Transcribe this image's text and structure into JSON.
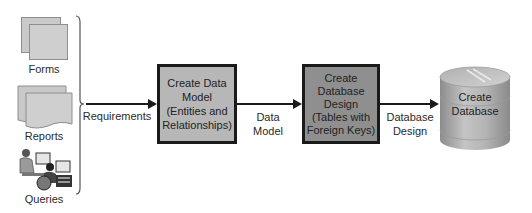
{
  "inputs": {
    "forms_label": "Forms",
    "reports_label": "Reports",
    "queries_label": "Queries"
  },
  "flow": {
    "arrow1_label": "Requirements",
    "step1": {
      "line1": "Create Data",
      "line2": "Model",
      "line3": "(Entities and",
      "line4": "Relationships)"
    },
    "arrow2_label_line1": "Data",
    "arrow2_label_line2": "Model",
    "step2": {
      "line1": "Create",
      "line2": "Database",
      "line3": "Design",
      "line4": "(Tables with",
      "line5": "Foreign Keys)"
    },
    "arrow3_label_line1": "Database",
    "arrow3_label_line2": "Design",
    "step3": {
      "line1": "Create",
      "line2": "Database"
    }
  },
  "colors": {
    "step1_fill": "#b7b7b7",
    "step2_fill": "#8f8f8f",
    "cylinder_fill": "#a8a8a8",
    "border": "#1a1a1a"
  }
}
